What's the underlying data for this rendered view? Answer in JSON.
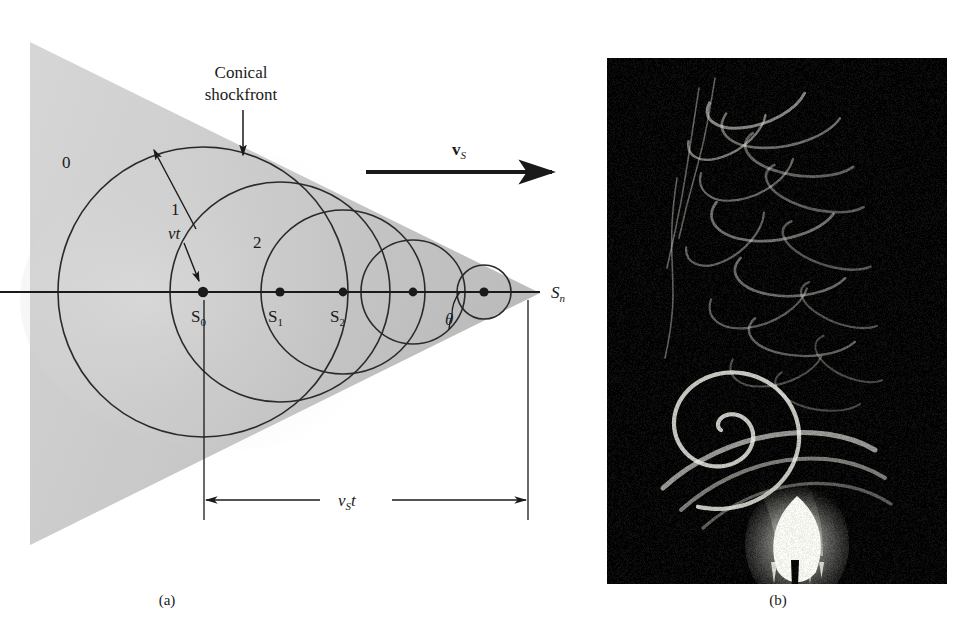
{
  "figure": {
    "panel_a": {
      "caption": "(a)",
      "annotations": {
        "conical_shockfront_line1": "Conical",
        "conical_shockfront_line2": "shockfront",
        "wavefront_radius_label": "vt",
        "angle_label": "θ",
        "velocity_vector_symbol": "v",
        "velocity_vector_subscript": "S",
        "distance_label_symbol": "v",
        "distance_label_subscript": "S",
        "distance_label_suffix": "t"
      },
      "wavefront_labels": [
        "0",
        "1",
        "2"
      ],
      "source_labels": [
        {
          "symbol": "S",
          "sub": "0"
        },
        {
          "symbol": "S",
          "sub": "1"
        },
        {
          "symbol": "S",
          "sub": "2"
        },
        {
          "symbol": "S",
          "sub": "n"
        }
      ],
      "geometry": {
        "axis_y": 292,
        "apex_x": 540,
        "cone_left_x": 30,
        "cone_top_y": 42,
        "cone_bottom_y": 545,
        "source_x": [
          203,
          280,
          343,
          413,
          484
        ],
        "wavefront_radii": [
          145,
          110,
          82,
          52,
          27
        ],
        "dimension_line_y": 500,
        "dimension_from_x": 204,
        "dimension_to_x": 528
      },
      "colors": {
        "cone_fill": "#c9c9c9",
        "line": "#1a1a1a",
        "background": "#ffffff"
      }
    },
    "panel_b": {
      "caption": "(b)",
      "description": "schlieren-photograph-candle-flame-plume",
      "colors": {
        "background": "#050505",
        "highlight": "#f5f5f0"
      }
    }
  }
}
